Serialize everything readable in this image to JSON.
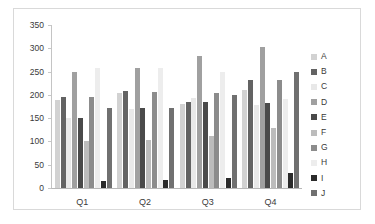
{
  "chart_data": {
    "type": "bar",
    "title": "",
    "xlabel": "",
    "ylabel": "",
    "categories": [
      "Q1",
      "Q2",
      "Q3",
      "Q4"
    ],
    "ylim": [
      0,
      350
    ],
    "yticks": [
      0,
      50,
      100,
      150,
      200,
      250,
      300,
      350
    ],
    "grid": false,
    "legend_position": "right",
    "series": [
      {
        "name": "A",
        "color": "#d2d2d2",
        "values": [
          190,
          205,
          180,
          210
        ]
      },
      {
        "name": "B",
        "color": "#636363",
        "values": [
          195,
          208,
          185,
          232
        ]
      },
      {
        "name": "C",
        "color": "#e8e8e8",
        "values": [
          150,
          170,
          193,
          178
        ]
      },
      {
        "name": "D",
        "color": "#a0a0a0",
        "values": [
          250,
          257,
          283,
          302
        ]
      },
      {
        "name": "E",
        "color": "#4a4a4a",
        "values": [
          150,
          172,
          185,
          182
        ]
      },
      {
        "name": "F",
        "color": "#bcbcbc",
        "values": [
          100,
          103,
          112,
          128
        ]
      },
      {
        "name": "G",
        "color": "#8c8c8c",
        "values": [
          196,
          206,
          205,
          232
        ]
      },
      {
        "name": "H",
        "color": "#ededed",
        "values": [
          258,
          258,
          250,
          192
        ]
      },
      {
        "name": "I",
        "color": "#2b2b2b",
        "values": [
          15,
          17,
          22,
          32
        ]
      },
      {
        "name": "J",
        "color": "#707070",
        "values": [
          172,
          172,
          200,
          250
        ]
      }
    ]
  },
  "legend": {
    "items": [
      {
        "label": "A"
      },
      {
        "label": "B"
      },
      {
        "label": "C"
      },
      {
        "label": "D"
      },
      {
        "label": "E"
      },
      {
        "label": "F"
      },
      {
        "label": "G"
      },
      {
        "label": "H"
      },
      {
        "label": "I"
      },
      {
        "label": "J"
      }
    ]
  }
}
